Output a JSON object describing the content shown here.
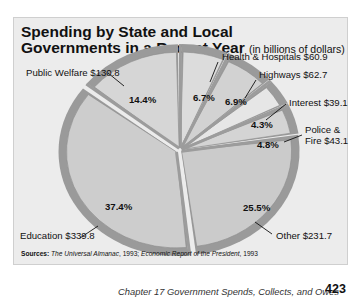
{
  "page": {
    "footer_chapter": "Chapter 17  Government Spends, Collects, and Owes",
    "page_number": "423"
  },
  "chart_data": {
    "type": "pie",
    "title": "Spending by State and Local Governments in a Recent Year",
    "title_line1": "Spending by State and Local",
    "title_line2": "Governments in a Recent Year",
    "subtitle": "(in billions of dollars)",
    "units": "billions of dollars",
    "slices": [
      {
        "name": "Health & Hospitals",
        "value": 60.9,
        "percent": 6.7,
        "label": "Health & Hospitals $60.9",
        "pct_label": "6.7%"
      },
      {
        "name": "Highways",
        "value": 62.7,
        "percent": 6.9,
        "label": "Highways $62.7",
        "pct_label": "6.9%"
      },
      {
        "name": "Interest",
        "value": 39.1,
        "percent": 4.3,
        "label": "Interest $39.1",
        "pct_label": "4.3%"
      },
      {
        "name": "Police & Fire",
        "value": 43.1,
        "percent": 4.8,
        "label_line1": "Police &",
        "label_line2": "Fire $43.1",
        "pct_label": "4.8%"
      },
      {
        "name": "Other",
        "value": 231.7,
        "percent": 25.5,
        "label": "Other $231.7",
        "pct_label": "25.5%"
      },
      {
        "name": "Education",
        "value": 339.8,
        "percent": 37.4,
        "label": "Education $339.8",
        "pct_label": "37.4%"
      },
      {
        "name": "Public Welfare",
        "value": 130.8,
        "percent": 14.4,
        "label": "Public Welfare $130.8",
        "pct_label": "14.4%"
      }
    ],
    "legend": "none (direct labels)",
    "sources_label": "Sources:",
    "sources_text1": "The Universal Almanac",
    "sources_text2": ", 1993; ",
    "sources_text3": "Economic Report of the President",
    "sources_text4": ", 1993"
  }
}
